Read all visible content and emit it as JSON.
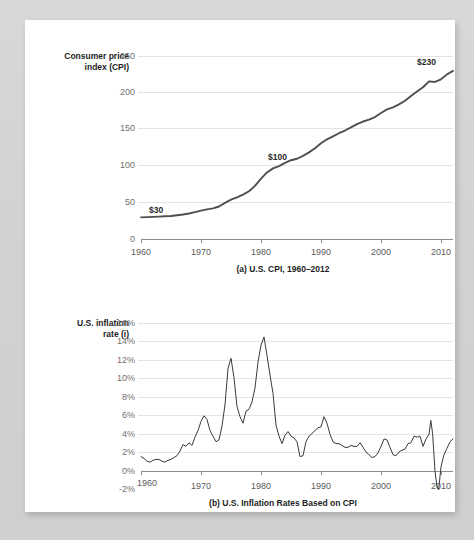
{
  "figure": {
    "panels": [
      {
        "id": "cpi",
        "caption": "(a) U.S. CPI, 1960–2012",
        "y_axis_title_line1": "Consumer price",
        "y_axis_title_line2": "index (CPI)",
        "y_ticks": [
          "250",
          "200",
          "150",
          "100",
          "50",
          "0"
        ],
        "x_ticks": [
          "1960",
          "1970",
          "1980",
          "1990",
          "2000",
          "2010"
        ],
        "annotations": [
          {
            "label": "$30",
            "x_year": 1961,
            "y_value": 30
          },
          {
            "label": "$100",
            "x_year": 1981,
            "y_value": 100
          },
          {
            "label": "$230",
            "x_year": 2010,
            "y_value": 230
          }
        ]
      },
      {
        "id": "inflation",
        "caption": "(b) U.S. Inflation Rates Based on CPI",
        "y_axis_title_line1": "U.S. inflation",
        "y_axis_title_line2": "rate (i)",
        "y_ticks": [
          "16%",
          "14%",
          "12%",
          "10%",
          "8%",
          "6%",
          "4%",
          "2%",
          "0%",
          "-2%"
        ],
        "x_ticks": [
          "1960",
          "1970",
          "1980",
          "1990",
          "2000",
          "2010"
        ],
        "annotations": []
      }
    ]
  },
  "colors": {
    "page_background": "#d3d3d3",
    "card_background": "#ffffff",
    "grid": "#e4e4e4",
    "axis": "#8c8c8c",
    "cpi_line": "#4f4f4f",
    "inflation_line": "#3a3a3a",
    "tick_text": "#6f6f6f",
    "label_text": "#1d1d1d"
  },
  "chart_data": [
    {
      "type": "line",
      "title": "(a) U.S. CPI, 1960–2012",
      "xlabel": "",
      "ylabel": "Consumer price index (CPI)",
      "xlim": [
        1960,
        2012
      ],
      "ylim": [
        0,
        250
      ],
      "grid": true,
      "legend": "none",
      "x": [
        1960,
        1961,
        1962,
        1963,
        1964,
        1965,
        1966,
        1967,
        1968,
        1969,
        1970,
        1971,
        1972,
        1973,
        1974,
        1975,
        1976,
        1977,
        1978,
        1979,
        1980,
        1981,
        1982,
        1983,
        1984,
        1985,
        1986,
        1987,
        1988,
        1989,
        1990,
        1991,
        1992,
        1993,
        1994,
        1995,
        1996,
        1997,
        1998,
        1999,
        2000,
        2001,
        2002,
        2003,
        2004,
        2005,
        2006,
        2007,
        2008,
        2009,
        2010,
        2011,
        2012
      ],
      "y": [
        29.6,
        29.9,
        30.2,
        30.6,
        31.0,
        31.5,
        32.4,
        33.4,
        34.8,
        36.7,
        38.8,
        40.5,
        41.8,
        44.4,
        49.3,
        53.8,
        56.9,
        60.6,
        65.2,
        72.6,
        82.4,
        90.9,
        96.5,
        99.6,
        103.9,
        107.6,
        109.6,
        113.6,
        118.3,
        124.0,
        130.7,
        136.2,
        140.3,
        144.5,
        148.2,
        152.4,
        156.9,
        160.5,
        163.0,
        166.6,
        172.2,
        177.1,
        179.9,
        184.0,
        188.9,
        195.3,
        201.6,
        207.3,
        215.3,
        214.5,
        218.1,
        224.9,
        229.6
      ]
    },
    {
      "type": "line",
      "title": "(b) U.S. Inflation Rates Based on CPI",
      "xlabel": "",
      "ylabel": "U.S. inflation rate (i)",
      "xlim": [
        1960,
        2012
      ],
      "ylim": [
        -2,
        16
      ],
      "grid": true,
      "legend": "none",
      "x": [
        1960.0,
        1960.5,
        1961.0,
        1961.5,
        1962.0,
        1962.5,
        1963.0,
        1963.5,
        1964.0,
        1964.5,
        1965.0,
        1965.5,
        1966.0,
        1966.5,
        1967.0,
        1967.5,
        1968.0,
        1968.5,
        1969.0,
        1969.5,
        1970.0,
        1970.5,
        1971.0,
        1971.5,
        1972.0,
        1972.5,
        1973.0,
        1973.5,
        1974.0,
        1974.5,
        1975.0,
        1975.5,
        1976.0,
        1976.5,
        1977.0,
        1977.5,
        1978.0,
        1978.5,
        1979.0,
        1979.5,
        1980.0,
        1980.5,
        1981.0,
        1981.5,
        1982.0,
        1982.5,
        1983.0,
        1983.5,
        1984.0,
        1984.5,
        1985.0,
        1985.5,
        1986.0,
        1986.5,
        1987.0,
        1987.5,
        1988.0,
        1988.5,
        1989.0,
        1989.5,
        1990.0,
        1990.5,
        1991.0,
        1991.5,
        1992.0,
        1992.5,
        1993.0,
        1993.5,
        1994.0,
        1994.5,
        1995.0,
        1995.5,
        1996.0,
        1996.5,
        1997.0,
        1997.5,
        1998.0,
        1998.5,
        1999.0,
        1999.5,
        2000.0,
        2000.5,
        2001.0,
        2001.5,
        2002.0,
        2002.5,
        2003.0,
        2003.5,
        2004.0,
        2004.5,
        2005.0,
        2005.5,
        2006.0,
        2006.5,
        2007.0,
        2007.5,
        2008.0,
        2008.3,
        2008.6,
        2009.0,
        2009.3,
        2009.6,
        2010.0,
        2010.5,
        2011.0,
        2011.5,
        2012.0
      ],
      "y": [
        1.6,
        1.4,
        1.1,
        1.0,
        1.2,
        1.3,
        1.3,
        1.1,
        1.0,
        1.2,
        1.3,
        1.5,
        1.7,
        2.2,
        2.9,
        2.7,
        3.1,
        2.8,
        3.7,
        4.4,
        5.4,
        6.0,
        5.6,
        4.4,
        3.8,
        3.2,
        3.4,
        4.9,
        7.2,
        11.1,
        12.2,
        10.1,
        7.0,
        5.9,
        5.2,
        6.5,
        6.7,
        7.5,
        9.0,
        11.8,
        13.6,
        14.5,
        12.5,
        10.4,
        8.4,
        5.0,
        3.8,
        3.0,
        3.9,
        4.3,
        3.8,
        3.6,
        3.2,
        1.6,
        1.7,
        3.2,
        3.8,
        4.1,
        4.4,
        4.7,
        4.8,
        5.9,
        5.2,
        4.0,
        3.2,
        3.0,
        3.0,
        2.8,
        2.6,
        2.6,
        2.8,
        2.7,
        2.7,
        3.1,
        2.6,
        2.1,
        1.8,
        1.5,
        1.6,
        2.0,
        2.7,
        3.5,
        3.4,
        2.6,
        1.8,
        1.7,
        2.1,
        2.3,
        2.4,
        3.0,
        3.1,
        3.8,
        3.7,
        3.8,
        2.7,
        3.5,
        4.0,
        5.5,
        4.1,
        0.0,
        -1.5,
        -2.0,
        0.5,
        1.8,
        2.5,
        3.2,
        3.5,
        2.9,
        2.1
      ]
    }
  ]
}
